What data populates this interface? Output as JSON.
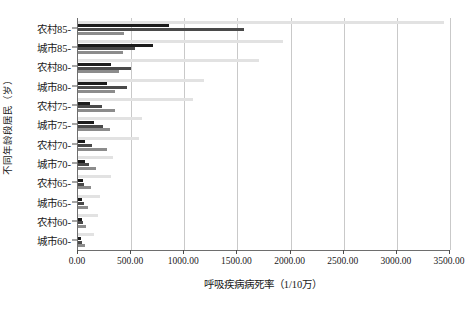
{
  "chart_data": {
    "type": "bar",
    "orientation": "horizontal",
    "title": "",
    "xlabel": "呼吸疾病病死率（1/10万）",
    "ylabel": "不同年龄段居民（岁）",
    "xlim": [
      0,
      3500
    ],
    "xticks": [
      0,
      500,
      1000,
      1500,
      2000,
      2500,
      3000,
      3500
    ],
    "xtick_labels": [
      "0.00",
      "500.00",
      "1000.00",
      "1500.00",
      "2000.00",
      "2500.00",
      "3000.00",
      "3500.00"
    ],
    "grid": true,
    "grid_axis": "x",
    "legend": "none",
    "categories": [
      "农村85-",
      "城市85-",
      "农村80-",
      "城市80-",
      "农村75-",
      "城市75-",
      "农村70-",
      "城市70-",
      "农村65-",
      "城市65-",
      "农村60-",
      "城市60-"
    ],
    "series": [
      {
        "name": "series-1",
        "color": "#e2e2e2",
        "values": [
          3440,
          1930,
          1705,
          1190,
          1080,
          600,
          570,
          330,
          310,
          210,
          190,
          150
        ]
      },
      {
        "name": "series-2",
        "color": "#1c1c1c",
        "values": [
          860,
          710,
          310,
          270,
          110,
          155,
          70,
          65,
          45,
          40,
          35,
          30
        ]
      },
      {
        "name": "series-3",
        "color": "#4a4a4a",
        "values": [
          1560,
          535,
          495,
          465,
          225,
          235,
          130,
          100,
          60,
          55,
          45,
          40
        ]
      },
      {
        "name": "series-4",
        "color": "#8c8c8c",
        "values": [
          430,
          420,
          390,
          350,
          345,
          305,
          275,
          165,
          120,
          90,
          75,
          65
        ]
      }
    ]
  }
}
